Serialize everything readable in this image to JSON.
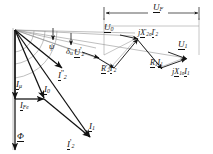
{
  "figure": {
    "type": "phasor-diagram",
    "domain": "electrical-machine-phasor-diagram",
    "background_color": "#ffffff",
    "line_color": "#111111",
    "thin_line_color": "#777777",
    "width": 213,
    "height": 154
  },
  "labels": {
    "u_f": "U",
    "u_f_sub": "F",
    "u_0": "U",
    "u_0_sub": "0",
    "u_2p": "U",
    "u_2p_sub": "2",
    "u_2p_prime": "'",
    "u_1": "U",
    "u_1_sub": "1",
    "jx2s_j": "j",
    "jx2s_x": "X",
    "jx2s_xprime": "'",
    "jx2s_xsub": "2σ",
    "jx2s_i": "I",
    "jx2s_iprime": "'",
    "jx2s_isub": "2",
    "r2i2_r": "R",
    "r2i2_rprime": "'",
    "r2i2_rsub": "2",
    "r2i2_i": "I",
    "r2i2_iprime": "'",
    "r2i2_isub": "2",
    "r1i1_r": "R",
    "r1i1_rsub": "1",
    "r1i1_i": "I",
    "r1i1_isub": "1",
    "jx1s_j": "j",
    "jx1s_x": "X",
    "jx1s_xsub": "1σ",
    "jx1s_i": "I",
    "jx1s_isub": "1",
    "i_mu": "I",
    "i_mu_sub": "μ",
    "i_0": "I",
    "i_0_sub": "0",
    "i_fe": "I",
    "i_fe_sub": "Fe",
    "i_1": "I",
    "i_1_sub": "1",
    "i_2_bottom": "I",
    "i_2_bottom_sub": "2",
    "i_2_bottom_prime": "'",
    "i_2_mid": "I",
    "i_2_mid_sub": "2",
    "i_2_mid_prime": "''",
    "phi": "Φ",
    "psi": "ψ",
    "delta_u": "δ",
    "delta_u_sub": "u"
  },
  "vectors": [
    {
      "name": "phi-flux",
      "label": "Φ",
      "from": [
        15,
        30
      ],
      "to": [
        15,
        148
      ]
    },
    {
      "name": "i-mu",
      "label": "Iμ",
      "from": [
        15,
        30
      ],
      "to": [
        15,
        97
      ]
    },
    {
      "name": "i-fe",
      "label": "IFe",
      "from": [
        15,
        97
      ],
      "to": [
        43,
        97
      ]
    },
    {
      "name": "i-0",
      "label": "I0",
      "from": [
        15,
        30
      ],
      "to": [
        43,
        97
      ]
    },
    {
      "name": "i-1",
      "label": "I1",
      "from": [
        15,
        30
      ],
      "to": [
        88,
        135
      ]
    },
    {
      "name": "i-2-prime-bottom",
      "label": "I'2",
      "from": [
        43,
        97
      ],
      "to": [
        88,
        135
      ]
    },
    {
      "name": "i-2-doubleprime-mid",
      "label": "I''2",
      "from": [
        15,
        30
      ],
      "to": [
        60,
        66
      ]
    },
    {
      "name": "u-0",
      "label": "U0",
      "from": [
        15,
        30
      ],
      "to": [
        133,
        36
      ]
    },
    {
      "name": "u-2-prime",
      "label": "U'2",
      "from": [
        15,
        30
      ],
      "to": [
        96,
        57
      ]
    },
    {
      "name": "u-1",
      "label": "U1",
      "from": [
        15,
        30
      ],
      "to": [
        182,
        57
      ]
    },
    {
      "name": "jx2s-i2",
      "label": "jX'2σI'2",
      "from": [
        112,
        65
      ],
      "to": [
        136,
        38
      ]
    },
    {
      "name": "r2s-i2",
      "label": "R'2I'2",
      "from": [
        96,
        58
      ],
      "to": [
        115,
        68
      ]
    },
    {
      "name": "r1-i1",
      "label": "R1I1",
      "from": [
        135,
        38
      ],
      "to": [
        162,
        67
      ]
    },
    {
      "name": "jx1s-i1",
      "label": "jX1σI1",
      "from": [
        160,
        66
      ],
      "to": [
        183,
        58
      ]
    }
  ],
  "dimension_lines": [
    {
      "name": "u-f-dimension",
      "label": "UF",
      "from": [
        104,
        13
      ],
      "to": [
        199,
        13
      ]
    }
  ],
  "angles": [
    {
      "name": "psi-angle",
      "label": "ψ",
      "vertex": [
        15,
        30
      ]
    },
    {
      "name": "delta-u-angle",
      "label": "δu",
      "vertex": [
        15,
        30
      ]
    }
  ]
}
